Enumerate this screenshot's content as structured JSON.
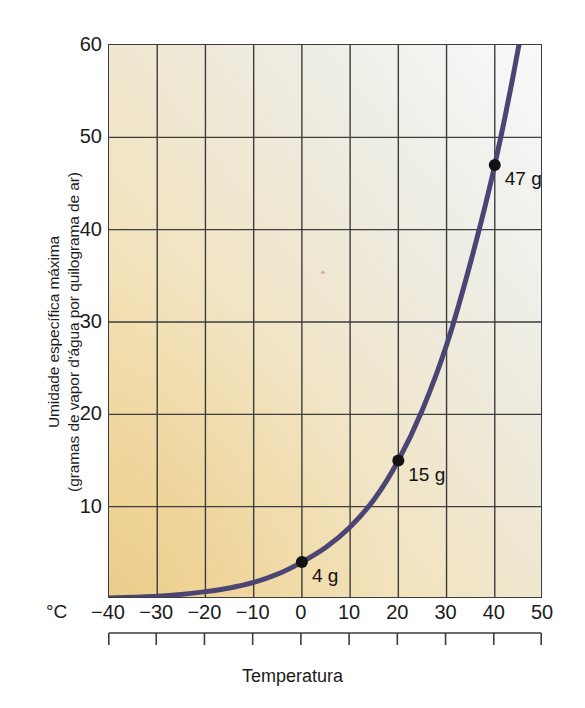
{
  "figure": {
    "x_axis_title": "Temperatura",
    "y_axis_title_line1": "Umidade específica máxima",
    "y_axis_title_line2": "(gramas de vapor d'água por quilograma de ar)",
    "unit_marker": "°C"
  },
  "chart_data": {
    "type": "line",
    "title": "",
    "subtitle": "",
    "xlabel": "Temperatura",
    "ylabel": "Umidade específica máxima (gramas de vapor d'água por quilograma de ar)",
    "x_unit": "°C",
    "xlim": [
      -40,
      50
    ],
    "ylim": [
      0,
      60
    ],
    "xticks": [
      -40,
      -30,
      -20,
      -10,
      0,
      10,
      20,
      30,
      40,
      50
    ],
    "xtick_labels": [
      "−40",
      "−30",
      "−20",
      "−10",
      "0",
      "10",
      "20",
      "30",
      "40",
      "50"
    ],
    "yticks": [
      10,
      20,
      30,
      40,
      50,
      60
    ],
    "ytick_labels": [
      "10",
      "20",
      "30",
      "40",
      "50",
      "60"
    ],
    "grid": true,
    "legend": "none",
    "series": [
      {
        "name": "Umidade específica máxima de saturação",
        "color": "#4a4573",
        "x": [
          -40,
          -35,
          -30,
          -25,
          -20,
          -15,
          -10,
          -5,
          0,
          5,
          10,
          15,
          20,
          25,
          30,
          35,
          40,
          45,
          48
        ],
        "values": [
          0.1,
          0.2,
          0.3,
          0.5,
          0.8,
          1.2,
          1.8,
          2.7,
          4.0,
          5.6,
          7.8,
          10.8,
          15.0,
          20.5,
          27.5,
          36.5,
          47.0,
          60.0,
          70.0
        ]
      }
    ],
    "annotations": [
      {
        "label": "4 g",
        "x": 0,
        "y": 4,
        "marker": true
      },
      {
        "label": "15 g",
        "x": 20,
        "y": 15,
        "marker": true
      },
      {
        "label": "47 g",
        "x": 40,
        "y": 47,
        "marker": true
      }
    ]
  }
}
